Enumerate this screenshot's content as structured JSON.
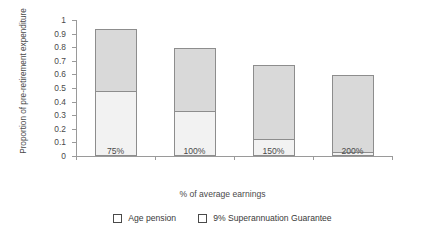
{
  "chart_data": {
    "type": "bar",
    "stacked": true,
    "title": "",
    "xlabel": "% of average earnings",
    "ylabel": "Proportion of pre-retirement expenditure",
    "categories": [
      "75%",
      "100%",
      "150%",
      "200%"
    ],
    "series": [
      {
        "name": "Age pension",
        "color": "#f2f2f2",
        "values": [
          0.47,
          0.32,
          0.12,
          0.02
        ]
      },
      {
        "name": "9% Superannuation Guarantee",
        "color": "#d9d9d9",
        "values": [
          0.46,
          0.47,
          0.54,
          0.57
        ]
      }
    ],
    "totals": [
      0.93,
      0.79,
      0.66,
      0.59
    ],
    "ylim": [
      0,
      1
    ],
    "ytick_labels": [
      "1",
      "0.9",
      "0.8",
      "0.7",
      "0.6",
      "0.5",
      "0.4",
      "0.3",
      "0.2",
      "0.1",
      "0"
    ],
    "ytick_values": [
      1,
      0.9,
      0.8,
      0.7,
      0.6,
      0.5,
      0.4,
      0.3,
      0.2,
      0.1,
      0
    ],
    "grid": false,
    "legend_position": "bottom"
  },
  "axes": {
    "y_title": "Proportion of pre-retirement expenditure",
    "x_title": "% of average earnings"
  },
  "legend": {
    "items": [
      {
        "label": "Age pension",
        "swatch": "legend-swatch-age-pension"
      },
      {
        "label": "9% Superannuation Guarantee",
        "swatch": "legend-swatch-super-guarantee"
      }
    ]
  }
}
